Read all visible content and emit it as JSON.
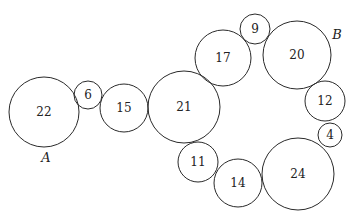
{
  "diagram": {
    "type": "tangent-circle-chain",
    "circles": [
      {
        "label": "22",
        "cx": 44,
        "cy": 112,
        "r": 35
      },
      {
        "label": "6",
        "cx": 88,
        "cy": 95,
        "r": 14
      },
      {
        "label": "15",
        "cx": 124,
        "cy": 108,
        "r": 24
      },
      {
        "label": "21",
        "cx": 184,
        "cy": 107,
        "r": 36
      },
      {
        "label": "17",
        "cx": 223,
        "cy": 58,
        "r": 28
      },
      {
        "label": "9",
        "cx": 255,
        "cy": 29,
        "r": 15
      },
      {
        "label": "20",
        "cx": 297,
        "cy": 55,
        "r": 34
      },
      {
        "label": "12",
        "cx": 325,
        "cy": 101,
        "r": 20
      },
      {
        "label": "4",
        "cx": 330,
        "cy": 135,
        "r": 12
      },
      {
        "label": "24",
        "cx": 298,
        "cy": 174,
        "r": 36
      },
      {
        "label": "14",
        "cx": 238,
        "cy": 183,
        "r": 24
      },
      {
        "label": "11",
        "cx": 198,
        "cy": 162,
        "r": 20
      }
    ],
    "points": [
      {
        "label": "A",
        "x": 46,
        "y": 157
      },
      {
        "label": "B",
        "x": 337,
        "y": 34
      }
    ]
  }
}
